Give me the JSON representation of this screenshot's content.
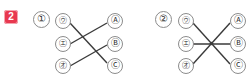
{
  "badge": {
    "label": "2",
    "color": "#e8384f",
    "text_color": "#ffffff"
  },
  "problems": [
    {
      "number": "①",
      "left_nodes": [
        "㋒",
        "㋓",
        "㋔"
      ],
      "right_nodes": [
        "Ⓐ",
        "Ⓑ",
        "Ⓒ"
      ],
      "connections": [
        {
          "from": "㋒",
          "to": "Ⓒ"
        },
        {
          "from": "㋓",
          "to": "Ⓐ"
        },
        {
          "from": "㋔",
          "to": "Ⓑ"
        }
      ],
      "crossing_style": "two-separate-crossings"
    },
    {
      "number": "②",
      "left_nodes": [
        "㋒",
        "㋓",
        "㋔"
      ],
      "right_nodes": [
        "Ⓐ",
        "Ⓑ",
        "Ⓒ"
      ],
      "connections": [
        {
          "from": "㋒",
          "to": "Ⓒ"
        },
        {
          "from": "㋓",
          "to": "Ⓑ"
        },
        {
          "from": "㋔",
          "to": "Ⓐ"
        }
      ],
      "crossing_style": "single-common-center"
    }
  ],
  "colors": {
    "line": "#3a3a3a",
    "circle_border": "#8c8c8c",
    "background": "#ffffff"
  }
}
